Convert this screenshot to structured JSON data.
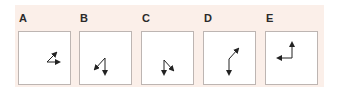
{
  "figure": {
    "background_color": "#fbefe9",
    "arrow_color": "#222222",
    "options": [
      {
        "label": "A",
        "description": "two arrows from common origin: one pointing up-right, one pointing right"
      },
      {
        "label": "B",
        "description": "two arrows from common origin: one pointing down-left, one pointing down"
      },
      {
        "label": "C",
        "description": "two arrows from common origin: one pointing down, one pointing down-right"
      },
      {
        "label": "D",
        "description": "bent path: arrow down from a joint, and diagonal arrow up-right from the joint"
      },
      {
        "label": "E",
        "description": "L-shape: arrow pointing up and arrow pointing left from corner"
      }
    ]
  }
}
